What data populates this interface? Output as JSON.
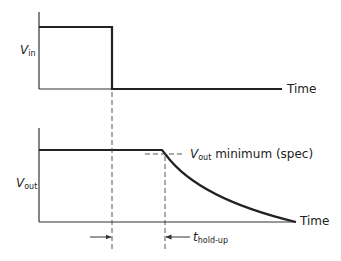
{
  "diagram": {
    "top_panel": {
      "ylabel_main": "V",
      "ylabel_sub": "in",
      "xlabel": "Time"
    },
    "bottom_panel": {
      "ylabel_main": "V",
      "ylabel_sub": "out",
      "xlabel": "Time",
      "spec_label_main": "V",
      "spec_label_sub": "out",
      "spec_label_rest": " minimum (spec)"
    },
    "interval_label_main": "t",
    "interval_label_sub": "hold-up",
    "colors": {
      "line": "#222222",
      "background": "#ffffff"
    }
  }
}
